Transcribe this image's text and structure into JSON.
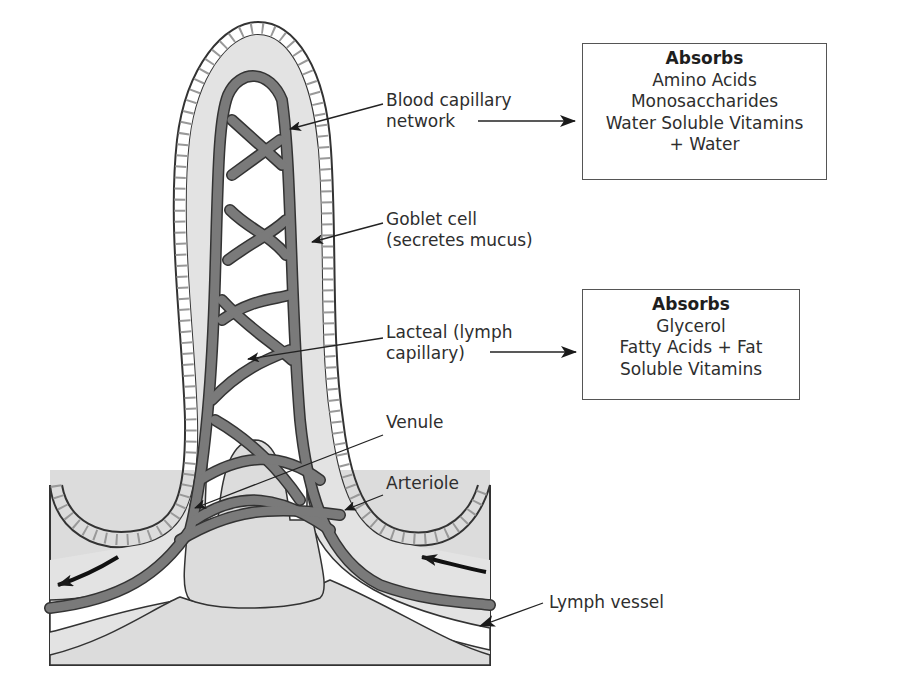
{
  "diagram": {
    "colors": {
      "tissue_fill": "#d9d9d9",
      "capillary_fill": "#7a7a7a",
      "outline": "#333333",
      "lumen_white": "#ffffff"
    }
  },
  "labels": {
    "blood_capillary": [
      "Blood capillary",
      "network"
    ],
    "goblet_cell": [
      "Goblet cell",
      "(secretes mucus)"
    ],
    "lacteal": [
      "Lacteal (lymph",
      "capillary)"
    ],
    "venule": "Venule",
    "arteriole": "Arteriole",
    "lymph_vessel": "Lymph vessel"
  },
  "boxes": {
    "blood": {
      "title": "Absorbs",
      "items": [
        "Amino Acids",
        "Monosaccharides",
        "Water Soluble Vitamins",
        "+ Water"
      ]
    },
    "lymph": {
      "title": "Absorbs",
      "items": [
        "Glycerol",
        "Fatty Acids + Fat",
        "Soluble Vitamins"
      ]
    }
  }
}
